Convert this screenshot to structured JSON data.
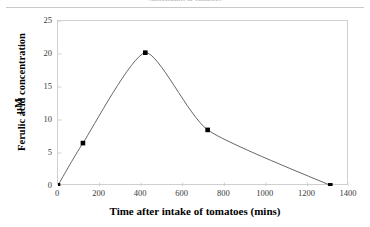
{
  "header": {
    "running_head": "Antioxidants in Tomatoes"
  },
  "chart_data": {
    "type": "line",
    "title": "",
    "xlabel": "Time after intake of tomatoes  (mins)",
    "ylabel": "Ferulic acid concentration",
    "yunit": "μM",
    "xlim": [
      0,
      1400
    ],
    "ylim": [
      0,
      25
    ],
    "xticks": [
      0,
      200,
      400,
      600,
      800,
      1000,
      1200,
      1400
    ],
    "yticks": [
      0,
      5,
      10,
      15,
      20,
      25
    ],
    "xtick_labels": [
      "0",
      "200",
      "400",
      "600",
      "800",
      "1000",
      "1200",
      "1400"
    ],
    "ytick_labels": [
      "0",
      "5",
      "10",
      "15",
      "20",
      "25"
    ],
    "grid": false,
    "legend": "none",
    "marker": "square",
    "marker_color": "#000000",
    "line_color": "#555555",
    "smoothed": true,
    "x": [
      0,
      120,
      420,
      720,
      1310
    ],
    "y": [
      0.1,
      6.5,
      20.2,
      8.5,
      0.1
    ],
    "series": [
      {
        "name": "Ferulic acid",
        "points": [
          {
            "x": 0,
            "y": 0.1
          },
          {
            "x": 120,
            "y": 6.5
          },
          {
            "x": 420,
            "y": 20.2
          },
          {
            "x": 720,
            "y": 8.5
          },
          {
            "x": 1310,
            "y": 0.1
          }
        ]
      }
    ]
  }
}
